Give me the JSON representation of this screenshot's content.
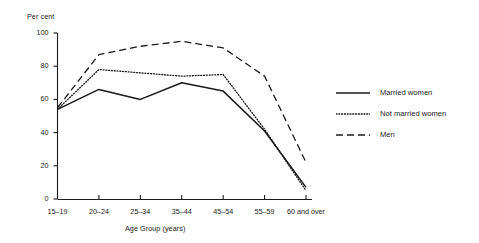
{
  "chart_data": {
    "type": "line",
    "title": "",
    "xlabel": "Age Group (years)",
    "ylabel": "Per cent",
    "categories": [
      "15–19",
      "20–24",
      "25–34",
      "35–44",
      "45–54",
      "55–59",
      "60 and over"
    ],
    "ylim": [
      0,
      100
    ],
    "yticks": [
      0,
      20,
      40,
      60,
      80,
      100
    ],
    "grid": false,
    "legend_position": "right",
    "series": [
      {
        "name": "Married women",
        "style": "solid",
        "color": "#1a1a1a",
        "values": [
          54,
          66,
          60,
          70,
          65,
          41,
          7
        ]
      },
      {
        "name": "Not married women",
        "style": "dotted",
        "color": "#1a1a1a",
        "values": [
          54,
          78,
          76,
          74,
          75,
          42,
          5
        ]
      },
      {
        "name": "Men",
        "style": "dashed",
        "color": "#1a1a1a",
        "values": [
          55,
          87,
          92,
          95,
          91,
          74,
          22
        ]
      }
    ]
  },
  "axes": {
    "y_title": "Per cent",
    "x_title": "Age Group (years)",
    "y_tick_labels": [
      "0",
      "20",
      "40",
      "60",
      "80",
      "100"
    ],
    "x_tick_labels": [
      "15–19",
      "20–24",
      "25–34",
      "35–44",
      "45–54",
      "55–59",
      "60 and over"
    ]
  },
  "legend": {
    "items": [
      {
        "label": "Married women",
        "key": "solid-line-key"
      },
      {
        "label": "Not married women",
        "key": "dotted-line-key"
      },
      {
        "label": "Men",
        "key": "dashed-line-key"
      }
    ]
  }
}
